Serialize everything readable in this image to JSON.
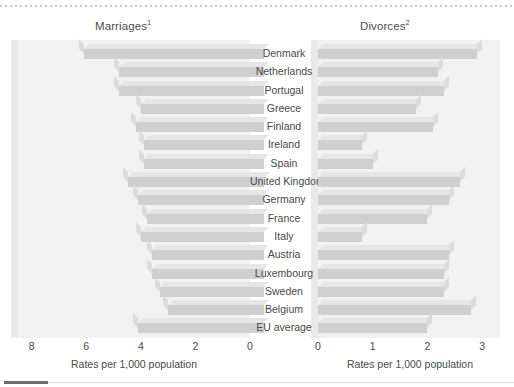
{
  "chart_data": [
    {
      "type": "bar",
      "title": "Marriages",
      "title_superscript": "1",
      "orientation": "horizontal",
      "axis_reversed": true,
      "xlabel": "Rates per 1,000 population",
      "ylabel": "",
      "xlim": [
        8,
        0
      ],
      "ticks": [
        8,
        6,
        4,
        2,
        0
      ],
      "tick_labels": [
        "8",
        "6",
        "4",
        "2",
        "0"
      ],
      "grid": false,
      "legend": "none",
      "categories": [
        "Denmark",
        "Netherlands",
        "Portugal",
        "Greece",
        "Finland",
        "Ireland",
        "Spain",
        "United Kingdom",
        "Germany",
        "France",
        "Italy",
        "Austria",
        "Luxembourg",
        "Sweden",
        "Belgium",
        "EU average"
      ],
      "values": [
        6.6,
        5.3,
        5.3,
        4.5,
        4.7,
        4.4,
        4.4,
        5.0,
        4.6,
        4.3,
        4.5,
        4.1,
        4.1,
        3.8,
        3.5,
        4.6
      ]
    },
    {
      "type": "bar",
      "title": "Divorces",
      "title_superscript": "2",
      "orientation": "horizontal",
      "axis_reversed": false,
      "xlabel": "Rates per 1,000 population",
      "ylabel": "",
      "xlim": [
        0,
        3
      ],
      "ticks": [
        0,
        1,
        2,
        3
      ],
      "tick_labels": [
        "0",
        "1",
        "2",
        "3"
      ],
      "grid": false,
      "legend": "none",
      "categories": [
        "Denmark",
        "Netherlands",
        "Portugal",
        "Greece",
        "Finland",
        "Ireland",
        "Spain",
        "United Kingdom",
        "Germany",
        "France",
        "Italy",
        "Austria",
        "Luxembourg",
        "Sweden",
        "Belgium",
        "EU average"
      ],
      "values": [
        2.9,
        2.2,
        2.3,
        1.8,
        2.1,
        0.8,
        1.0,
        2.6,
        2.4,
        2.0,
        0.8,
        2.4,
        2.3,
        2.3,
        2.8,
        2.0
      ]
    }
  ],
  "colors": {
    "bar_face": "#cfcfcf",
    "bar_top": "#e6e6e6",
    "bar_cap": "#dcdcdc",
    "panel": "#f2f2f2",
    "text": "#4a4a4a",
    "marker": "#6f6f6f"
  }
}
